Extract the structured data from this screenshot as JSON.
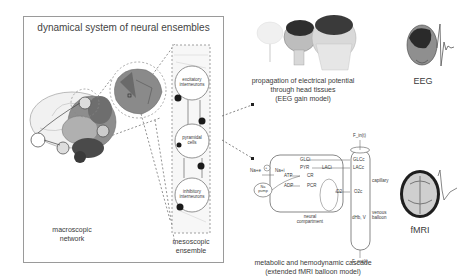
{
  "left_panel": {
    "title": "dynamical system of neural ensembles",
    "macroscopic_label_line1": "macroscopic",
    "macroscopic_label_line2": "network",
    "mesoscopic_label_line1": "mesoscopic",
    "mesoscopic_label_line2": "ensemble",
    "populations": [
      {
        "line1": "excitatory",
        "line2": "interneurons"
      },
      {
        "line1": "pyramidal",
        "line2": "cells"
      },
      {
        "line1": "inhibitory",
        "line2": "interneurons"
      }
    ]
  },
  "eeg_branch": {
    "caption_line1": "propagation of electrical potential",
    "caption_line2": "through head tissues",
    "caption_line3": "(EEG gain model)",
    "output_label": "EEG"
  },
  "fmri_branch": {
    "caption_line1": "metabolic and hemodynamic cascade",
    "caption_line2": "(extended fMRI balloon model)",
    "output_label": "fMRI",
    "neural_compartment_line1": "neural",
    "neural_compartment_line2": "compartment",
    "capillary_label": "capillary",
    "venous_label_line1": "venous",
    "venous_label_line2": "balloon",
    "f_in": "F_in(t)",
    "f_out": "F_out(t)",
    "species": {
      "na_e": "Na+e",
      "na_i": "Na+i",
      "na_pump_line1": "Na",
      "na_pump_line2": "pump",
      "glc_i": "GLCi",
      "pyr": "PYR",
      "lac_i": "LACi",
      "atp": "ATP",
      "adp": "ADP",
      "cr": "CR",
      "pcr": "PCR",
      "o2_i": "O2",
      "glc_c": "GLCc",
      "lac_c": "LACc",
      "o2_c": "O2c",
      "dhb_v": "dHb, V",
      "plus": "+"
    }
  },
  "colors": {
    "panel_border": "#9a9a9a",
    "text": "#3a3a3a",
    "dotted_line": "#777777",
    "brain_gray": "#8d8d8d",
    "brain_dark": "#5a5a5a",
    "node_dark": "#1a1a1a"
  }
}
